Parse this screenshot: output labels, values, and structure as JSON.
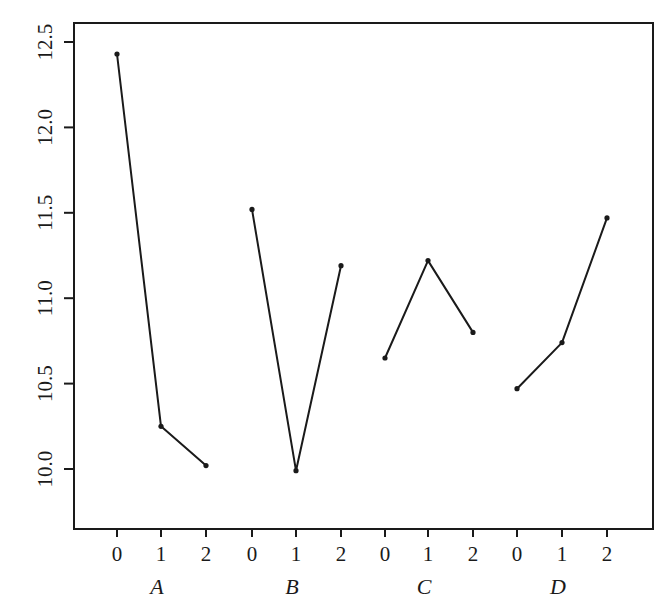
{
  "chart_data": {
    "type": "line",
    "title": "",
    "xlabel": "",
    "ylabel": "",
    "ylim": [
      9.65,
      12.6
    ],
    "grid": false,
    "legend": null,
    "y_ticks": [
      "10.0",
      "10.5",
      "11.0",
      "11.5",
      "12.0",
      "12.5"
    ],
    "y_tick_values": [
      10.0,
      10.5,
      11.0,
      11.5,
      12.0,
      12.5
    ],
    "groups": [
      {
        "name": "A",
        "levels": [
          "0",
          "1",
          "2"
        ],
        "values": [
          12.43,
          10.25,
          10.02
        ]
      },
      {
        "name": "B",
        "levels": [
          "0",
          "1",
          "2"
        ],
        "values": [
          11.52,
          9.99,
          11.19
        ]
      },
      {
        "name": "C",
        "levels": [
          "0",
          "1",
          "2"
        ],
        "values": [
          10.65,
          11.22,
          10.8
        ]
      },
      {
        "name": "D",
        "levels": [
          "0",
          "1",
          "2"
        ],
        "values": [
          10.47,
          10.74,
          11.47
        ]
      }
    ]
  },
  "layout": {
    "box": {
      "left": 74,
      "top": 23,
      "right": 653,
      "bottom": 529
    },
    "y_map": {
      "v1": 12.5,
      "p1": 42,
      "v2": 10.0,
      "p2": 469
    },
    "x_positions": [
      [
        117,
        161,
        206
      ],
      [
        252,
        296,
        341
      ],
      [
        385,
        428,
        473
      ],
      [
        517,
        562,
        607
      ]
    ],
    "line_color": "#1a1a1a",
    "point_radius": 2.6
  }
}
